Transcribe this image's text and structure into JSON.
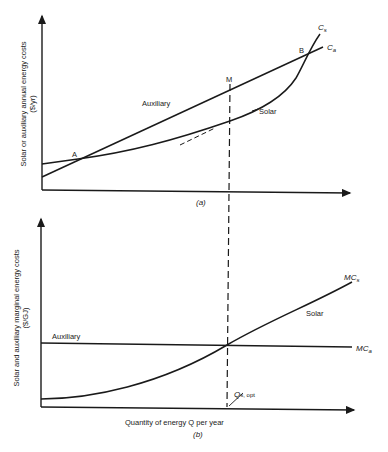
{
  "panel_a": {
    "y_label_line1": "Solar or auxiliary annual energy costs",
    "y_label_line2": "($/yr)",
    "caption": "(a)",
    "curve_auxiliary_label": "Auxiliary",
    "curve_solar_label": "Solar",
    "curve_cs_label": "C",
    "curve_cs_sub": "s",
    "curve_ca_label": "C",
    "curve_ca_sub": "a",
    "point_a": "A",
    "point_b": "B",
    "point_m": "M"
  },
  "panel_b": {
    "y_label_line1": "Solar and auxiliary marginal energy costs",
    "y_label_line2": "($/GJ)",
    "x_label": "Quantity of energy Q per year",
    "caption": "(b)",
    "curve_auxiliary_label": "Auxiliary",
    "curve_solar_label": "Solar",
    "curve_mcs_label": "MC",
    "curve_mcs_sub": "s",
    "curve_mca_label": "MC",
    "curve_mca_sub": "a",
    "q_opt_label": "Q",
    "q_opt_sub": "s, opt"
  },
  "colors": {
    "line": "#1a1a1a",
    "background": "#ffffff"
  }
}
